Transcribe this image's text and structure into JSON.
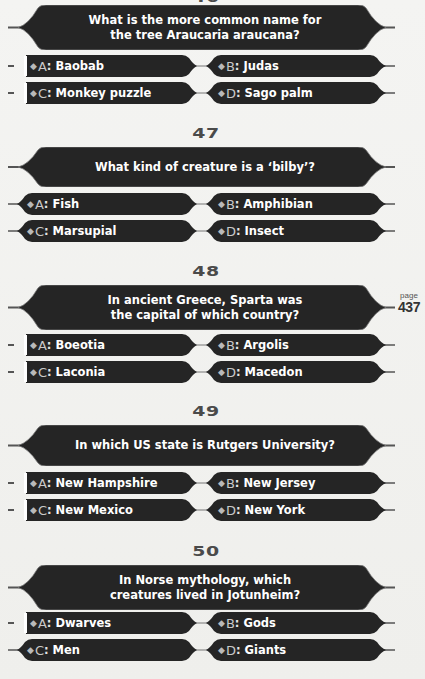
{
  "page": {
    "label_word": "page",
    "number": "437"
  },
  "colors": {
    "panel": "#252525",
    "panel_edge": "#6a6a6a",
    "question_number": "#4a4a4a",
    "answer_text": "#ffffff",
    "letter_label": "#c9c9c9",
    "background": "#f2f2f0"
  },
  "questions": [
    {
      "number": "46",
      "text": "What is the more common name for the tree Araucaria araucana?",
      "lines": [
        "What is the more common name for",
        "the tree Araucaria araucana?"
      ],
      "answers": [
        {
          "letter": "A",
          "text": "Baobab"
        },
        {
          "letter": "B",
          "text": "Judas"
        },
        {
          "letter": "C",
          "text": "Monkey puzzle"
        },
        {
          "letter": "D",
          "text": "Sago palm"
        }
      ]
    },
    {
      "number": "47",
      "text": "What kind of creature is a ‘bilby’?",
      "lines": [
        "What kind of creature is a ‘bilby’?"
      ],
      "answers": [
        {
          "letter": "A",
          "text": "Fish"
        },
        {
          "letter": "B",
          "text": "Amphibian"
        },
        {
          "letter": "C",
          "text": "Marsupial"
        },
        {
          "letter": "D",
          "text": "Insect"
        }
      ]
    },
    {
      "number": "48",
      "text": "In ancient Greece, Sparta was the capital of which country?",
      "lines": [
        "In ancient Greece, Sparta was",
        "the capital of which country?"
      ],
      "answers": [
        {
          "letter": "A",
          "text": "Boeotia"
        },
        {
          "letter": "B",
          "text": "Argolis"
        },
        {
          "letter": "C",
          "text": "Laconia"
        },
        {
          "letter": "D",
          "text": "Macedon"
        }
      ]
    },
    {
      "number": "49",
      "text": "In which US state is Rutgers University?",
      "lines": [
        "In which US state is Rutgers University?"
      ],
      "answers": [
        {
          "letter": "A",
          "text": "New Hampshire"
        },
        {
          "letter": "B",
          "text": "New Jersey"
        },
        {
          "letter": "C",
          "text": "New Mexico"
        },
        {
          "letter": "D",
          "text": "New York"
        }
      ]
    },
    {
      "number": "50",
      "text": "In Norse mythology, which creatures lived in Jotunheim?",
      "lines": [
        "In Norse mythology, which",
        "creatures lived in Jotunheim?"
      ],
      "answers": [
        {
          "letter": "A",
          "text": "Dwarves"
        },
        {
          "letter": "B",
          "text": "Gods"
        },
        {
          "letter": "C",
          "text": "Men"
        },
        {
          "letter": "D",
          "text": "Giants"
        }
      ]
    }
  ]
}
